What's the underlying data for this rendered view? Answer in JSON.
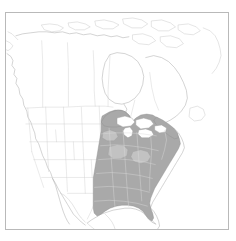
{
  "figure": {
    "title": "",
    "caption": "",
    "type": "species-distribution-map",
    "region_depicted": "North America",
    "frame": {
      "border_color": "#b9b9b9",
      "background_color": "#ffffff"
    }
  },
  "map": {
    "basemap_label": "North America outline with state and provincial boundaries",
    "coastline_color": "#b0b0b0",
    "boundary_color": "#cfcfcf",
    "lake_color": "#ffffff"
  },
  "range": {
    "label": "Shaded distribution range",
    "extent_description": "Eastern United States from eastern Texas and the Gulf Coast north to the Great Lakes and southern Ontario, east to the Atlantic coast and New England, south through northern Florida",
    "fill_color": "#a9a9a9",
    "secondary_fill_color": "#c2c2c2",
    "outline_color": "#8f8f8f"
  },
  "legend": {
    "visible": false,
    "entries": []
  },
  "annotations": []
}
